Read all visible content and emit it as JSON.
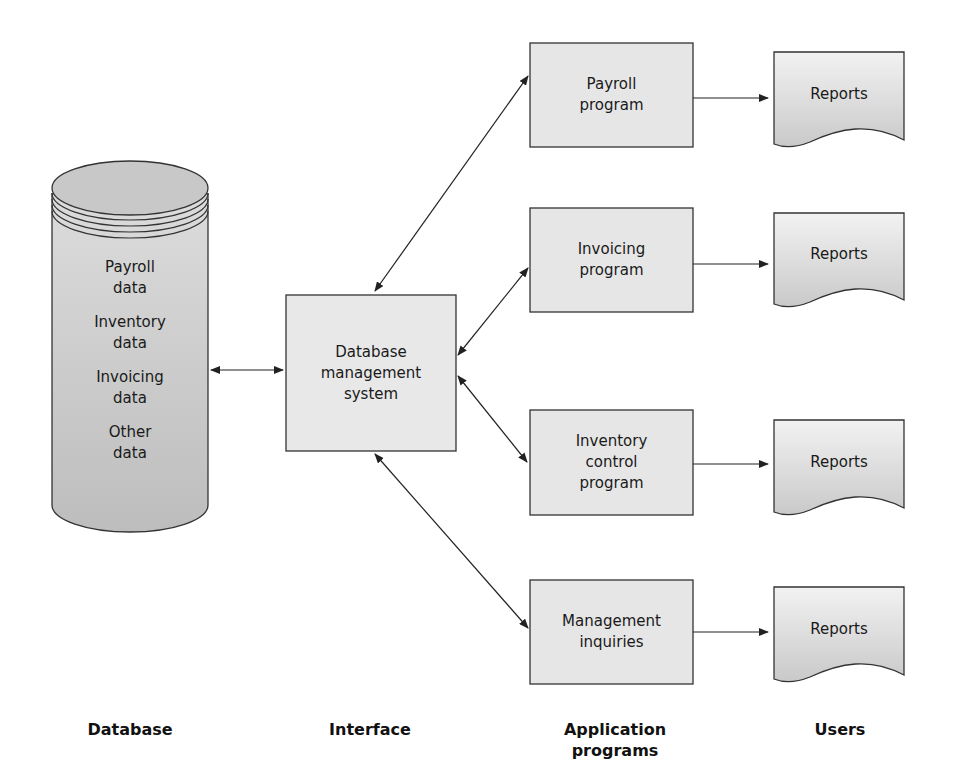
{
  "diagram": {
    "database": {
      "items": [
        "Payroll data",
        "Inventory data",
        "Invoicing data",
        "Other data"
      ],
      "lines": [
        "Payroll",
        "data",
        "Inventory",
        "data",
        "Invoicing",
        "data",
        "Other",
        "data"
      ]
    },
    "interface": {
      "lines": [
        "Database",
        "management",
        "system"
      ]
    },
    "programs": [
      {
        "lines": [
          "Payroll",
          "program"
        ]
      },
      {
        "lines": [
          "Invoicing",
          "program"
        ]
      },
      {
        "lines": [
          "Inventory",
          "control",
          "program"
        ]
      },
      {
        "lines": [
          "Management",
          "inquiries"
        ]
      }
    ],
    "reports": [
      "Reports",
      "Reports",
      "Reports",
      "Reports"
    ],
    "columns": {
      "database": "Database",
      "interface": "Interface",
      "application_1": "Application",
      "application_2": "programs",
      "users": "Users"
    },
    "colors": {
      "box_fill": "#e6e6e6",
      "stroke": "#333333",
      "text": "#1a1a1a"
    }
  }
}
